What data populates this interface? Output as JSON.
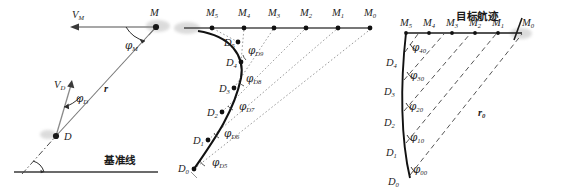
{
  "figure": {
    "type": "technical-diagram",
    "background": "#ffffff",
    "ink_color": "#1d1d1d",
    "line_color": "#555555",
    "dash_color": "#777777"
  },
  "panels": [
    {
      "id": "left",
      "name": "instantaneous-geometry",
      "labels": {
        "vm": "V",
        "vm_sub": "M",
        "m_point": "M",
        "phi_m": "φ",
        "phi_m_sub": "M",
        "r": "r",
        "vd": "V",
        "vd_sub": "D",
        "phi_d": "φ",
        "phi_d_sub": "D",
        "d_point": "D",
        "baseline": "基准线"
      }
    },
    {
      "id": "middle",
      "name": "sampled-trajectory-geometry",
      "m_points": [
        "M₅",
        "M₄",
        "M₃",
        "M₂",
        "M₁",
        "M₀"
      ],
      "m_base": "M",
      "m_subs": [
        "5",
        "4",
        "3",
        "2",
        "1",
        "0"
      ],
      "d_points": [
        "D₅",
        "D₄",
        "D₃",
        "D₂",
        "D₁",
        "D₀"
      ],
      "d_base": "D",
      "d_subs": [
        "5",
        "4",
        "3",
        "2",
        "1",
        "0"
      ],
      "phi_base": "φ",
      "phi_subs": [
        "D9",
        "D8",
        "D7",
        "D6",
        "D5"
      ],
      "angles": [
        "φD9",
        "φD8",
        "φD7",
        "φD6",
        "φD5"
      ]
    },
    {
      "id": "right",
      "name": "target-track-geometry",
      "title": "目标航迹",
      "m_points": [
        "M₅",
        "M₄",
        "M₃",
        "M₂",
        "M₁",
        "M₀"
      ],
      "m_base": "M",
      "m_subs": [
        "5",
        "4",
        "3",
        "2",
        "1",
        "0"
      ],
      "d_points": [
        "D₄",
        "D₃",
        "D₂",
        "D₁",
        "D₀"
      ],
      "d_base": "D",
      "d_subs": [
        "4",
        "3",
        "2",
        "1",
        "0"
      ],
      "phi_base": "φ",
      "phi_subs": [
        "40",
        "30",
        "20",
        "10",
        "00"
      ],
      "r0": "r",
      "r0_sub": "0"
    }
  ]
}
